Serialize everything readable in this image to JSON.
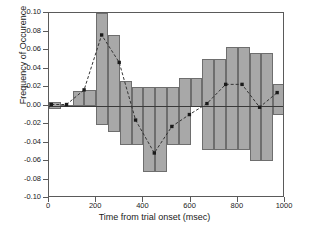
{
  "chart_data": {
    "type": "bar",
    "title": "",
    "xlabel": "Time from trial onset (msec)",
    "ylabel": "Frequency of Occurence",
    "xlim": [
      0,
      1000
    ],
    "ylim": [
      -0.1,
      0.1
    ],
    "xticks": [
      0,
      200,
      400,
      600,
      800,
      1000
    ],
    "xtick_labels": [
      "0",
      "200",
      "400",
      "600",
      "800",
      "1000"
    ],
    "yticks": [
      0.1,
      0.08,
      0.06,
      0.04,
      0.02,
      0.0,
      -0.02,
      -0.04,
      -0.06,
      -0.08,
      -0.1
    ],
    "ytick_labels": [
      "0.10",
      "0.08",
      "0.06",
      "0.04",
      "0.02",
      "0.00",
      "-0.02",
      "-0.04",
      "-0.06",
      "-0.08",
      "-0.10"
    ],
    "grid": false,
    "legend": null,
    "bar_color": "#a8a8a8",
    "bar_edge_color": "#6e6e6e",
    "line_color": "#333333",
    "marker_color": "#1a1a1a",
    "zero_line_color": "#3a3a3a",
    "bin_width": 50,
    "bars": [
      {
        "x0": 0,
        "x1": 50,
        "top": 0.004,
        "bottom": -0.004
      },
      {
        "x0": 50,
        "x1": 100,
        "top": 0.001,
        "bottom": -0.001
      },
      {
        "x0": 100,
        "x1": 150,
        "top": 0.016,
        "bottom": -0.001
      },
      {
        "x0": 150,
        "x1": 200,
        "top": 0.017,
        "bottom": -0.001
      },
      {
        "x0": 200,
        "x1": 250,
        "top": 0.1,
        "bottom": -0.021
      },
      {
        "x0": 250,
        "x1": 300,
        "top": 0.076,
        "bottom": -0.029
      },
      {
        "x0": 300,
        "x1": 350,
        "top": 0.027,
        "bottom": -0.043
      },
      {
        "x0": 350,
        "x1": 400,
        "top": 0.02,
        "bottom": -0.043
      },
      {
        "x0": 400,
        "x1": 450,
        "top": 0.02,
        "bottom": -0.072
      },
      {
        "x0": 450,
        "x1": 500,
        "top": 0.02,
        "bottom": -0.072
      },
      {
        "x0": 500,
        "x1": 550,
        "top": 0.02,
        "bottom": -0.043
      },
      {
        "x0": 550,
        "x1": 600,
        "top": 0.03,
        "bottom": -0.043
      },
      {
        "x0": 600,
        "x1": 650,
        "top": 0.03,
        "bottom": -0.002
      },
      {
        "x0": 650,
        "x1": 700,
        "top": 0.05,
        "bottom": -0.048
      },
      {
        "x0": 700,
        "x1": 750,
        "top": 0.05,
        "bottom": -0.048
      },
      {
        "x0": 750,
        "x1": 800,
        "top": 0.063,
        "bottom": -0.048
      },
      {
        "x0": 800,
        "x1": 850,
        "top": 0.063,
        "bottom": -0.048
      },
      {
        "x0": 850,
        "x1": 900,
        "top": 0.057,
        "bottom": -0.06
      },
      {
        "x0": 900,
        "x1": 950,
        "top": 0.057,
        "bottom": -0.06
      },
      {
        "x0": 950,
        "x1": 1000,
        "top": 0.023,
        "bottom": -0.01
      }
    ],
    "series": [
      {
        "name": "mean frequency",
        "style": "dashed-line-with-square-markers",
        "points": [
          {
            "x": 10,
            "y": 0.0
          },
          {
            "x": 75,
            "y": 0.0
          },
          {
            "x": 150,
            "y": 0.016
          },
          {
            "x": 225,
            "y": 0.076
          },
          {
            "x": 300,
            "y": 0.046
          },
          {
            "x": 370,
            "y": -0.017
          },
          {
            "x": 450,
            "y": -0.053
          },
          {
            "x": 525,
            "y": -0.024
          },
          {
            "x": 600,
            "y": -0.011
          },
          {
            "x": 675,
            "y": 0.001
          },
          {
            "x": 755,
            "y": 0.022
          },
          {
            "x": 825,
            "y": 0.022
          },
          {
            "x": 900,
            "y": -0.003
          },
          {
            "x": 975,
            "y": 0.013
          }
        ]
      }
    ]
  }
}
